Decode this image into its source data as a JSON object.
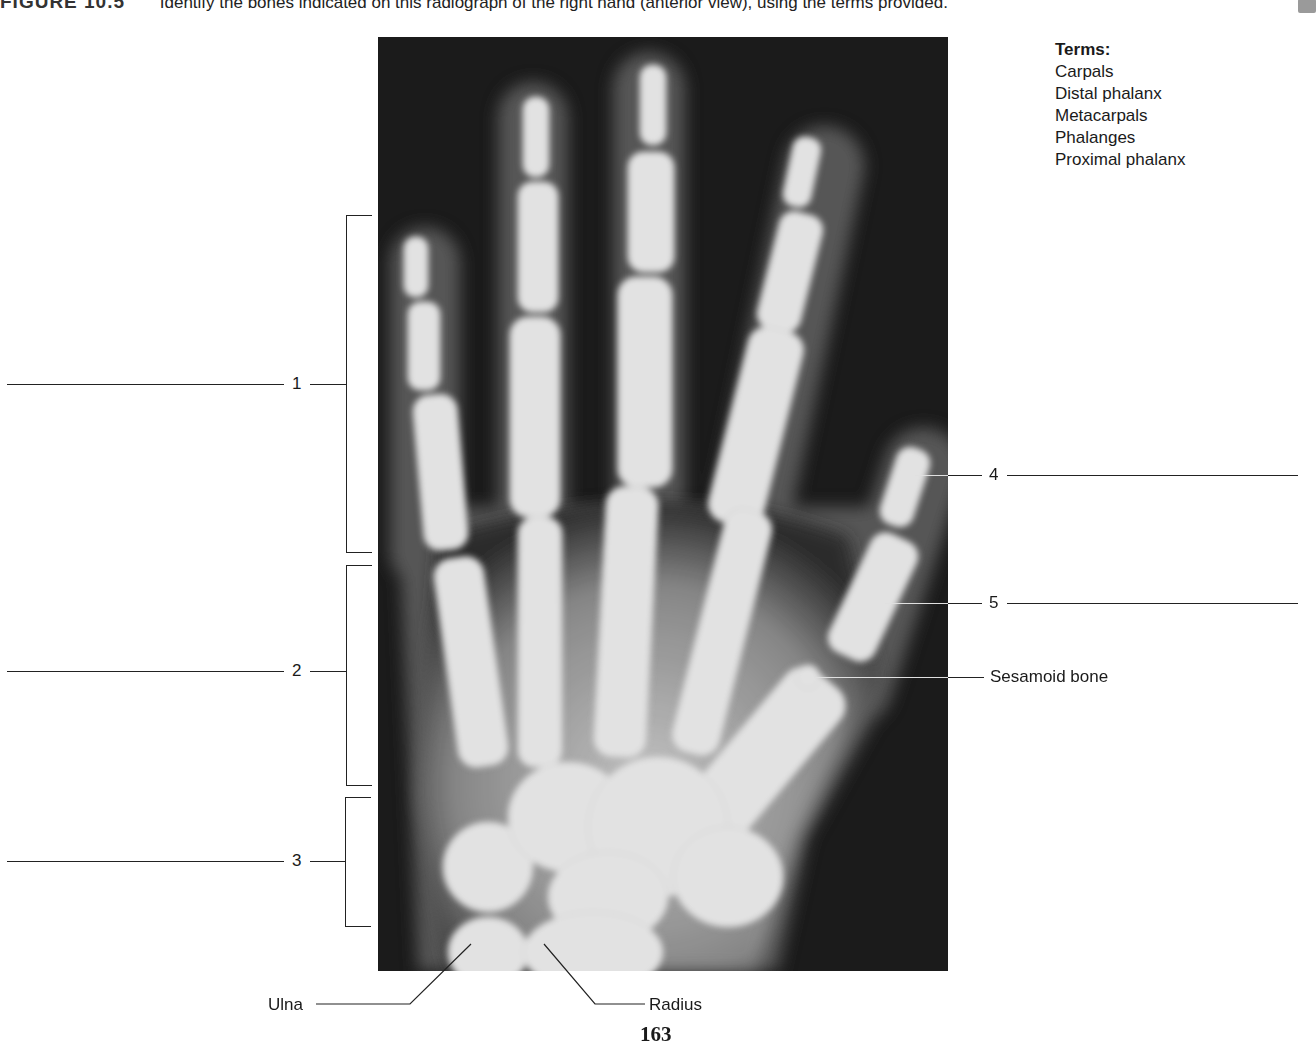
{
  "header": {
    "figure_label": "FIGURE 10.5",
    "instruction": "Identify the bones indicated on this radiograph of the right hand (anterior view), using the terms provided."
  },
  "terms": {
    "title": "Terms:",
    "items": [
      "Carpals",
      "Distal phalanx",
      "Metacarpals",
      "Phalanges",
      "Proximal phalanx"
    ]
  },
  "callouts": {
    "numbered": [
      {
        "number": "1",
        "side": "left",
        "answer_blank": ""
      },
      {
        "number": "2",
        "side": "left",
        "answer_blank": ""
      },
      {
        "number": "3",
        "side": "left",
        "answer_blank": ""
      },
      {
        "number": "4",
        "side": "right",
        "answer_blank": ""
      },
      {
        "number": "5",
        "side": "right",
        "answer_blank": ""
      }
    ],
    "named": {
      "sesamoid": "Sesamoid bone",
      "ulna": "Ulna",
      "radius": "Radius"
    }
  },
  "image": {
    "description": "Radiograph of the right hand, anterior view",
    "background_color": "#1b1b1b",
    "bone_color": "#e8e8e8",
    "soft_tissue_color": "#5a5a5a"
  },
  "footer": {
    "page_number": "163"
  }
}
